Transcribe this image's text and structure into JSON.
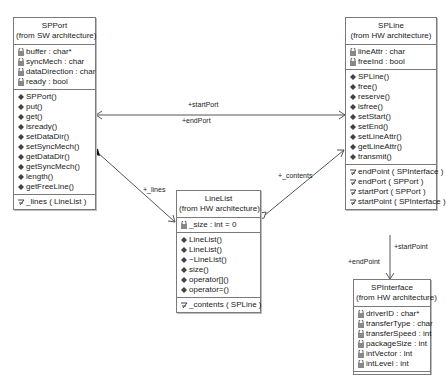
{
  "classes": {
    "spport": {
      "name": "SPPort",
      "package": "(from SW architecture)",
      "attributes": [
        "buffer : char*",
        "syncMech : char",
        "dataDirection : char",
        "ready : bool"
      ],
      "operations": [
        "SPPort()",
        "put()",
        "get()",
        "isready()",
        "setDataDir()",
        "setSyncMech()",
        "getDataDir()",
        "getSyncMech()",
        "length()",
        "getFreeLine()"
      ],
      "associations": [
        "_lines ( LineList )"
      ]
    },
    "spline": {
      "name": "SPLine",
      "package": "(from HW architecture)",
      "attributes": [
        "lineAttr : char",
        "freeInd : bool"
      ],
      "operations": [
        "SPLine()",
        "free()",
        "reserve()",
        "isfree()",
        "setStart()",
        "setEnd()",
        "setLineAttr()",
        "getLineAttr()",
        "transmit()"
      ],
      "associations": [
        "endPoint ( SPInterface )",
        "endPort ( SPPort )",
        "startPort ( SPPort )",
        "startPoint ( SPInterface )"
      ]
    },
    "linelist": {
      "name": "LineList",
      "package": "(from HW architecture)",
      "attributes": [
        "_size : int = 0"
      ],
      "operations": [
        "LineList()",
        "LineList()",
        "~LineList()",
        "size()",
        "operator[]()",
        "operator=()"
      ],
      "associations": [
        "_contents ( SPLine )"
      ]
    },
    "spinterface": {
      "name": "SPInterface",
      "package": "(from HW architecture)",
      "attributes": [
        "driverID : char*",
        "transferType : char",
        "transferSpeed : int",
        "packageSize : int",
        "intVector : int",
        "intLevel : int"
      ]
    }
  },
  "relations": {
    "start_port": "+startPort",
    "end_port": "+endPort",
    "lines": "+_lines",
    "contents": "+_contents",
    "start_point": "+startPoint",
    "end_point": "+endPoint"
  }
}
